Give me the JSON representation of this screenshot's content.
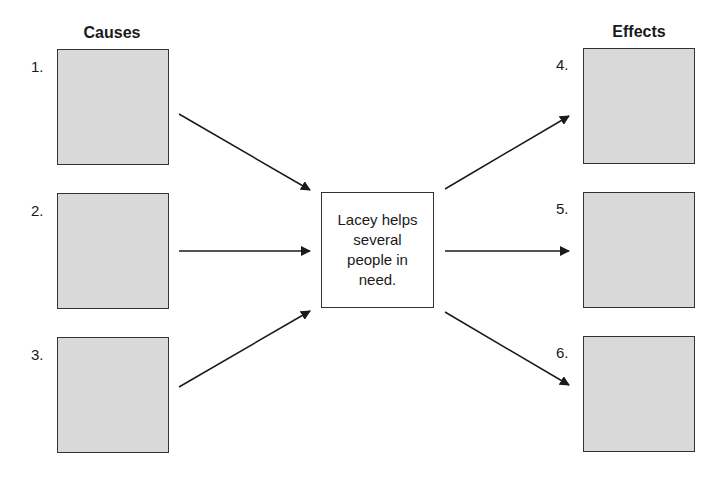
{
  "headings": {
    "causes": "Causes",
    "effects": "Effects"
  },
  "center": {
    "text": "Lacey helps several people in need."
  },
  "causes": [
    {
      "number": "1.",
      "value": ""
    },
    {
      "number": "2.",
      "value": ""
    },
    {
      "number": "3.",
      "value": ""
    }
  ],
  "effects": [
    {
      "number": "4.",
      "value": ""
    },
    {
      "number": "5.",
      "value": ""
    },
    {
      "number": "6.",
      "value": ""
    }
  ],
  "colors": {
    "box_fill": "#d9d9d9",
    "border": "#333333",
    "arrow": "#1a1a1a"
  }
}
